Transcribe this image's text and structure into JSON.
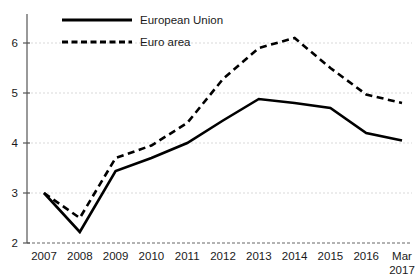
{
  "chart_data": {
    "type": "line",
    "title": "",
    "subtitle": "",
    "xlabel": "",
    "ylabel": "",
    "ylim": [
      2,
      6.5
    ],
    "yticks": [
      2,
      3,
      4,
      5,
      6
    ],
    "ytick_labels": [
      "2",
      "3",
      "4",
      "5",
      "6"
    ],
    "grid": true,
    "legend_position": "top-left",
    "categories": [
      "2007",
      "2008",
      "2009",
      "2010",
      "2011",
      "2012",
      "2013",
      "2014",
      "2015",
      "2016",
      "Mar 2017"
    ],
    "xtick_labels": [
      {
        "line1": "2007",
        "line2": ""
      },
      {
        "line1": "2008",
        "line2": ""
      },
      {
        "line1": "2009",
        "line2": ""
      },
      {
        "line1": "2010",
        "line2": ""
      },
      {
        "line1": "2011",
        "line2": ""
      },
      {
        "line1": "2012",
        "line2": ""
      },
      {
        "line1": "2013",
        "line2": ""
      },
      {
        "line1": "2014",
        "line2": ""
      },
      {
        "line1": "2015",
        "line2": ""
      },
      {
        "line1": "2016",
        "line2": ""
      },
      {
        "line1": "Mar",
        "line2": "2017"
      }
    ],
    "series": [
      {
        "name": "European Union",
        "style": "solid",
        "color": "#000000",
        "values": [
          3.0,
          2.22,
          3.44,
          3.7,
          4.0,
          4.45,
          4.88,
          4.8,
          4.7,
          4.2,
          4.05
        ]
      },
      {
        "name": "Euro area",
        "style": "dashed",
        "color": "#000000",
        "values": [
          3.0,
          2.5,
          3.7,
          3.95,
          4.4,
          5.28,
          5.9,
          6.1,
          5.5,
          4.97,
          4.8
        ]
      }
    ]
  },
  "legend": {
    "entries": [
      {
        "label": "European Union",
        "style": "solid"
      },
      {
        "label": "Euro area",
        "style": "dashed"
      }
    ]
  },
  "axes": {
    "y_axis_name": "y-axis",
    "x_axis_name": "x-axis"
  }
}
